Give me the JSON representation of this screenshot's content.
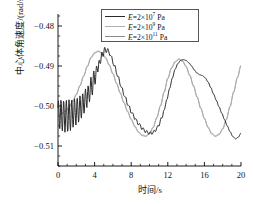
{
  "chart_data": {
    "type": "line",
    "title": "",
    "xlabel": "时间/s",
    "ylabel": "中心体角速度/(rad/s)",
    "xlim": [
      0,
      20
    ],
    "ylim": [
      -0.515,
      -0.477
    ],
    "xticks": [
      "0",
      "4",
      "8",
      "12",
      "16",
      "20"
    ],
    "xtick_values": [
      0,
      4,
      8,
      12,
      16,
      20
    ],
    "yticks": [
      "−0.48",
      "−0.49",
      "−0.50",
      "−0.51"
    ],
    "ytick_values": [
      -0.48,
      -0.49,
      -0.5,
      -0.51
    ],
    "grid": false,
    "minor_ticks": true,
    "legend_position": "top-center",
    "series": [
      {
        "name": "E=2×10⁷ Pa",
        "label_prefix": "E",
        "label_eq": "=2×10",
        "label_exp": "7",
        "label_unit": "Pa",
        "color": "#2b2b2b",
        "width": 1.0,
        "x": [
          0,
          0.15,
          0.3,
          0.45,
          0.6,
          0.75,
          0.9,
          1.05,
          1.2,
          1.35,
          1.5,
          1.65,
          1.8,
          1.95,
          2.1,
          2.25,
          2.4,
          2.55,
          2.7,
          2.85,
          3.0,
          3.15,
          3.3,
          3.45,
          3.6,
          3.75,
          3.9,
          4.05,
          4.2,
          4.35,
          4.5,
          4.65,
          4.8,
          4.95,
          5.1,
          5.25,
          5.4,
          5.55,
          5.7,
          5.85,
          6.0,
          6.2,
          6.4,
          6.6,
          6.8,
          7.0,
          7.2,
          7.4,
          7.6,
          7.8,
          8.0,
          8.2,
          8.4,
          8.6,
          8.8,
          9.0,
          9.2,
          9.4,
          9.6,
          9.8,
          10.0,
          10.2,
          10.4,
          10.6,
          10.8,
          11.0,
          11.3,
          11.6,
          11.9,
          12.2,
          12.5,
          12.8,
          13.1,
          13.4,
          13.7,
          14.0,
          14.3,
          14.6,
          14.9,
          15.2,
          15.5,
          15.8,
          16.1,
          16.4,
          16.7,
          17.0,
          17.3,
          17.6,
          17.9,
          18.2,
          18.5,
          18.8,
          19.1,
          19.4,
          19.7,
          20.0
        ],
        "y": [
          -0.5005,
          -0.5045,
          -0.4995,
          -0.5055,
          -0.4992,
          -0.506,
          -0.499,
          -0.5062,
          -0.4988,
          -0.5058,
          -0.4986,
          -0.5052,
          -0.4984,
          -0.5046,
          -0.498,
          -0.504,
          -0.4976,
          -0.503,
          -0.4968,
          -0.5018,
          -0.4958,
          -0.5004,
          -0.4946,
          -0.4988,
          -0.4932,
          -0.4968,
          -0.4916,
          -0.4946,
          -0.4898,
          -0.492,
          -0.488,
          -0.4896,
          -0.4866,
          -0.4872,
          -0.4858,
          -0.4862,
          -0.4859,
          -0.4866,
          -0.487,
          -0.488,
          -0.489,
          -0.4902,
          -0.4916,
          -0.493,
          -0.4944,
          -0.4958,
          -0.497,
          -0.4982,
          -0.4994,
          -0.5004,
          -0.5014,
          -0.5022,
          -0.503,
          -0.5038,
          -0.5044,
          -0.505,
          -0.5056,
          -0.506,
          -0.5064,
          -0.5066,
          -0.5068,
          -0.5068,
          -0.5066,
          -0.5062,
          -0.5056,
          -0.5048,
          -0.5032,
          -0.501,
          -0.4984,
          -0.4956,
          -0.493,
          -0.4908,
          -0.4894,
          -0.4886,
          -0.4884,
          -0.4886,
          -0.4892,
          -0.49,
          -0.491,
          -0.4918,
          -0.4922,
          -0.4924,
          -0.493,
          -0.494,
          -0.4954,
          -0.497,
          -0.4986,
          -0.5002,
          -0.5018,
          -0.5034,
          -0.505,
          -0.5064,
          -0.5076,
          -0.5082,
          -0.5078,
          -0.5068
        ],
        "oscillation": {
          "amplitude": 0.0035,
          "decay": 1.3,
          "freq": 3.4,
          "until_t": 3.2
        }
      },
      {
        "name": "E=2×10⁹ Pa",
        "label_prefix": "E",
        "label_eq": "=2×10",
        "label_exp": "9",
        "label_unit": "Pa",
        "color": "#b0b0b0",
        "width": 0.9,
        "x": [
          0,
          0.4,
          0.8,
          1.2,
          1.6,
          2.0,
          2.4,
          2.8,
          3.2,
          3.6,
          4.0,
          4.4,
          4.8,
          5.2,
          5.6,
          6.0,
          6.4,
          6.8,
          7.2,
          7.6,
          8.0,
          8.4,
          8.8,
          9.2,
          9.6,
          10.0,
          10.4,
          10.8,
          11.2,
          11.6,
          12.0,
          12.4,
          12.8,
          13.2,
          13.6,
          14.0,
          14.4,
          14.8,
          15.2,
          15.6,
          16.0,
          16.4,
          16.8,
          17.2,
          17.6,
          18.0,
          18.4,
          18.8,
          19.2,
          19.6,
          20.0
        ],
        "y": [
          -0.502,
          -0.5018,
          -0.5012,
          -0.5002,
          -0.4988,
          -0.497,
          -0.4948,
          -0.4924,
          -0.49,
          -0.4878,
          -0.4866,
          -0.4862,
          -0.4866,
          -0.4878,
          -0.4896,
          -0.4918,
          -0.4942,
          -0.4966,
          -0.499,
          -0.5012,
          -0.5032,
          -0.505,
          -0.5064,
          -0.5072,
          -0.5074,
          -0.5068,
          -0.5052,
          -0.5028,
          -0.4998,
          -0.4964,
          -0.493,
          -0.4904,
          -0.4888,
          -0.4882,
          -0.4886,
          -0.49,
          -0.4922,
          -0.4948,
          -0.4976,
          -0.5004,
          -0.503,
          -0.5052,
          -0.5068,
          -0.5074,
          -0.507,
          -0.5056,
          -0.5032,
          -0.5,
          -0.4964,
          -0.4928,
          -0.4898
        ]
      },
      {
        "name": "E=2×10¹¹ Pa",
        "label_prefix": "E",
        "label_eq": "=2×10",
        "label_exp": "11",
        "label_unit": "Pa",
        "color": "#8a8a8a",
        "width": 0.9,
        "x": [
          0,
          0.4,
          0.8,
          1.2,
          1.6,
          2.0,
          2.4,
          2.8,
          3.2,
          3.6,
          4.0,
          4.4,
          4.8,
          5.2,
          5.6,
          6.0,
          6.4,
          6.8,
          7.2,
          7.6,
          8.0,
          8.4,
          8.8,
          9.2,
          9.6,
          10.0,
          10.4,
          10.8,
          11.2,
          11.6,
          12.0,
          12.4,
          12.8,
          13.2,
          13.6,
          14.0,
          14.4,
          14.8,
          15.2,
          15.6,
          16.0,
          16.4,
          16.8,
          17.2,
          17.6,
          18.0,
          18.4,
          18.8,
          19.2,
          19.6,
          20.0
        ],
        "y": [
          -0.5022,
          -0.502,
          -0.5014,
          -0.5004,
          -0.499,
          -0.4972,
          -0.495,
          -0.4926,
          -0.4902,
          -0.488,
          -0.4868,
          -0.4864,
          -0.4868,
          -0.488,
          -0.4898,
          -0.492,
          -0.4944,
          -0.4968,
          -0.4992,
          -0.5014,
          -0.5034,
          -0.5052,
          -0.5066,
          -0.5074,
          -0.5076,
          -0.507,
          -0.5054,
          -0.503,
          -0.5,
          -0.4966,
          -0.4932,
          -0.4906,
          -0.489,
          -0.4884,
          -0.4888,
          -0.4902,
          -0.4924,
          -0.495,
          -0.4978,
          -0.5006,
          -0.5032,
          -0.5054,
          -0.507,
          -0.5076,
          -0.5072,
          -0.5058,
          -0.5034,
          -0.5002,
          -0.4966,
          -0.493,
          -0.49
        ]
      }
    ]
  }
}
